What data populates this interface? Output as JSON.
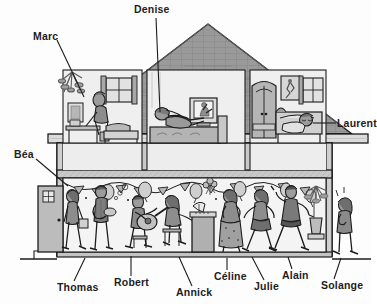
{
  "image": {
    "title": "Cutaway house illustration with named people",
    "width": 371,
    "height": 304,
    "background_color": "#fdfdfd",
    "line_color": "#1d1d1d",
    "roof_color": "#9a9a9a",
    "wall_color": "#d8d8d8",
    "room_color": "#efefef",
    "figure_color": "#8d8d8d"
  },
  "labels": [
    {
      "id": "marc",
      "name": "Marc",
      "x": 33,
      "y": 31,
      "leader": {
        "x1": 57,
        "y1": 40,
        "x2": 84,
        "y2": 97
      }
    },
    {
      "id": "denise",
      "name": "Denise",
      "x": 134,
      "y": 4,
      "leader": {
        "x1": 156,
        "y1": 18,
        "x2": 160,
        "y2": 112
      }
    },
    {
      "id": "laurent",
      "name": "Laurent",
      "x": 337,
      "y": 118,
      "leader": {
        "x1": 336,
        "y1": 123,
        "x2": 313,
        "y2": 123
      }
    },
    {
      "id": "bea",
      "name": "Béa",
      "x": 14,
      "y": 149,
      "leader": {
        "x1": 36,
        "y1": 159,
        "x2": 68,
        "y2": 186
      }
    },
    {
      "id": "thomas",
      "name": "Thomas",
      "x": 57,
      "y": 282,
      "leader": {
        "x1": 74,
        "y1": 281,
        "x2": 85,
        "y2": 258
      }
    },
    {
      "id": "robert",
      "name": "Robert",
      "x": 114,
      "y": 277,
      "leader": {
        "x1": 131,
        "y1": 276,
        "x2": 131,
        "y2": 256
      }
    },
    {
      "id": "annick",
      "name": "Annick",
      "x": 176,
      "y": 287,
      "leader": {
        "x1": 192,
        "y1": 286,
        "x2": 179,
        "y2": 257
      }
    },
    {
      "id": "celine",
      "name": "Céline",
      "x": 214,
      "y": 271,
      "leader": {
        "x1": 227,
        "y1": 270,
        "x2": 227,
        "y2": 258
      }
    },
    {
      "id": "julie",
      "name": "Julie",
      "x": 254,
      "y": 281,
      "leader": {
        "x1": 264,
        "y1": 280,
        "x2": 252,
        "y2": 257
      }
    },
    {
      "id": "alain",
      "name": "Alain",
      "x": 282,
      "y": 270,
      "leader": {
        "x1": 292,
        "y1": 269,
        "x2": 288,
        "y2": 257
      }
    },
    {
      "id": "solange",
      "name": "Solange",
      "x": 321,
      "y": 280,
      "leader": {
        "x1": 334,
        "y1": 279,
        "x2": 341,
        "y2": 258
      }
    }
  ],
  "scene": {
    "floors": [
      {
        "id": "upper-floor",
        "name": "upper floor bedrooms",
        "rooms": [
          {
            "id": "room-left",
            "occupant": "Marc",
            "items": [
              "plant",
              "desk",
              "framed-picture",
              "window",
              "bed",
              "chair"
            ]
          },
          {
            "id": "room-middle",
            "occupant": "Denise",
            "items": [
              "sofa-bed",
              "television",
              "lamp"
            ]
          },
          {
            "id": "room-right",
            "occupant": "Laurent",
            "items": [
              "wardrobe",
              "poster",
              "window",
              "bed",
              "nightstand"
            ]
          }
        ]
      },
      {
        "id": "ground-floor",
        "name": "ground floor party room",
        "occupants": [
          "Béa",
          "Thomas",
          "Robert",
          "Annick",
          "Céline",
          "Julie",
          "Alain",
          "Solange"
        ],
        "items": [
          "front-door",
          "bunting-garland",
          "balloons",
          "guitar",
          "piano",
          "stool",
          "potted-plant",
          "flower-vase"
        ]
      }
    ]
  }
}
